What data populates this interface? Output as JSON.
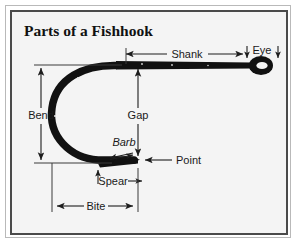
{
  "figure": {
    "title": "Parts of a Fishhook",
    "subject": "fishhook",
    "frame": {
      "outer_border_color": "#b9b9b9",
      "inner_border_color": "#4a4a4a",
      "background_color": "#f4f4f4"
    },
    "ink_color": "#111111",
    "label_color": "#1a1a1a"
  },
  "labels": {
    "shank": "Shank",
    "eye": "Eye",
    "bend": "Bend",
    "gap": "Gap",
    "barb": "Barb",
    "point": "Point",
    "spear": "Spear",
    "bite": "Bite"
  },
  "annotations": [
    {
      "name": "shank",
      "label": "Shank",
      "arrow": "double-horizontal",
      "orientation": "horizontal",
      "measures": "straight length from bend start to eye"
    },
    {
      "name": "eye",
      "label": "Eye",
      "arrow": "two-down",
      "orientation": "vertical",
      "measures": "loop at the end of the shank"
    },
    {
      "name": "bend",
      "label": "Bend",
      "arrow": "double-vertical",
      "orientation": "vertical",
      "measures": "vertical depth of the curve"
    },
    {
      "name": "gap",
      "label": "Gap",
      "arrow": "double-vertical",
      "orientation": "vertical",
      "measures": "shank to point opening"
    },
    {
      "name": "barb",
      "label": "Barb",
      "arrow": "double-diagonal",
      "orientation": "diagonal",
      "measures": "backward facing spike"
    },
    {
      "name": "point",
      "label": "Point",
      "arrow": "single-left",
      "orientation": "horizontal",
      "measures": "sharpened tip"
    },
    {
      "name": "spear",
      "label": "Spear",
      "arrow": "double-horizontal",
      "orientation": "horizontal",
      "measures": "straight run below the barb"
    },
    {
      "name": "bite",
      "label": "Bite",
      "arrow": "double-horizontal",
      "orientation": "horizontal",
      "measures": "width from bend to point"
    }
  ]
}
